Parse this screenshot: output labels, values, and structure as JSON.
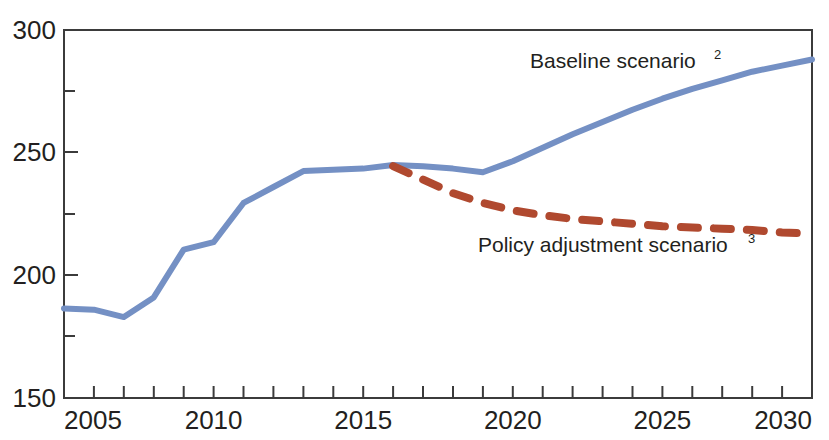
{
  "chart_data": {
    "type": "line",
    "title": "",
    "subtitle": "",
    "xlabel": "",
    "ylabel": "",
    "xlim": [
      2005,
      2030
    ],
    "ylim": [
      150,
      300
    ],
    "grid": false,
    "legend_position": "inline-annotations",
    "x_ticks_major": [
      "2005",
      "2010",
      "2015",
      "2020",
      "2025",
      "2030"
    ],
    "x_tick_values_major": [
      2005,
      2010,
      2015,
      2020,
      2025,
      2030
    ],
    "x_tick_interval_minor": 1,
    "y_ticks_major": [
      "300",
      "250",
      "200",
      "150"
    ],
    "y_tick_values_major": [
      300,
      250,
      200,
      150
    ],
    "y_tick_values_minor": [
      275,
      225,
      175
    ],
    "series": [
      {
        "name": "Baseline scenario",
        "footnote": "2",
        "color": "#7490c4",
        "style": "solid",
        "label_text": "Baseline scenario",
        "x": [
          2005,
          2006,
          2007,
          2008,
          2009,
          2010,
          2011,
          2012,
          2013,
          2014,
          2015,
          2016,
          2017,
          2018,
          2019,
          2020,
          2021,
          2022,
          2023,
          2024,
          2025,
          2026,
          2027,
          2028,
          2029,
          2030
        ],
        "values": [
          186.5,
          186.0,
          183.0,
          191.0,
          210.5,
          213.5,
          229.5,
          236.0,
          242.5,
          243.0,
          243.5,
          245.0,
          244.5,
          243.5,
          242.0,
          246.5,
          252.0,
          257.5,
          262.5,
          267.5,
          272.0,
          276.0,
          279.5,
          283.0,
          285.5,
          288.0
        ]
      },
      {
        "name": "Policy adjustment scenario",
        "footnote": "3",
        "color": "#b0492f",
        "style": "dashed",
        "label_text": "Policy adjustment scenario",
        "x": [
          2016,
          2017,
          2018,
          2019,
          2020,
          2021,
          2022,
          2023,
          2024,
          2025,
          2026,
          2027,
          2028,
          2029,
          2030
        ],
        "values": [
          244.5,
          239.0,
          233.5,
          229.5,
          226.5,
          224.5,
          223.0,
          222.0,
          221.0,
          220.0,
          219.5,
          219.0,
          218.5,
          217.5,
          217.0
        ]
      }
    ]
  },
  "annotations": {
    "baseline_label": {
      "text": "Baseline scenario",
      "superscript": "2",
      "x_px": 530,
      "y_px": 68
    },
    "policy_label": {
      "text": "Policy adjustment scenario",
      "superscript": "3",
      "x_px": 478,
      "y_px": 252
    }
  },
  "colors": {
    "baseline": "#7490c4",
    "policy": "#b0492f",
    "axis": "#3b3b3b",
    "text": "#231f20",
    "background": "#ffffff"
  }
}
